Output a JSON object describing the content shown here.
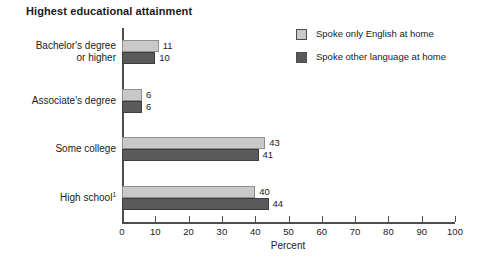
{
  "chart_data": {
    "type": "bar",
    "orientation": "horizontal",
    "title": "Highest educational attainment",
    "xlabel": "Percent",
    "ylabel": "",
    "xlim": [
      0,
      100
    ],
    "xticks": [
      0,
      10,
      20,
      30,
      40,
      50,
      60,
      70,
      80,
      90,
      100
    ],
    "xtick_labels": [
      "0",
      "10",
      "20",
      "30",
      "40",
      "50",
      "60",
      "70",
      "80",
      "90",
      "100"
    ],
    "grid": false,
    "legend_position": "top-right",
    "categories": [
      "Bachelor's degree or higher",
      "Associate's degree",
      "Some college",
      "High school"
    ],
    "category_lines": [
      [
        "Bachelor's degree",
        "or higher"
      ],
      [
        "Associate's degree"
      ],
      [
        "Some college"
      ],
      [
        "High school"
      ]
    ],
    "category_footnotes": [
      "",
      "",
      "",
      "1"
    ],
    "series": [
      {
        "name": "Spoke only English at home",
        "color": "#c9c9c9",
        "values": [
          11,
          6,
          43,
          40
        ],
        "value_labels": [
          "11",
          "6",
          "43",
          "40"
        ]
      },
      {
        "name": "Spoke other language at home",
        "color": "#5a5a5a",
        "values": [
          10,
          6,
          41,
          44
        ],
        "value_labels": [
          "10",
          "6",
          "41",
          "44"
        ]
      }
    ]
  },
  "legend": {
    "items": [
      {
        "label": "Spoke only English at home",
        "color": "#c9c9c9"
      },
      {
        "label": "Spoke other language at home",
        "color": "#5a5a5a"
      }
    ]
  }
}
